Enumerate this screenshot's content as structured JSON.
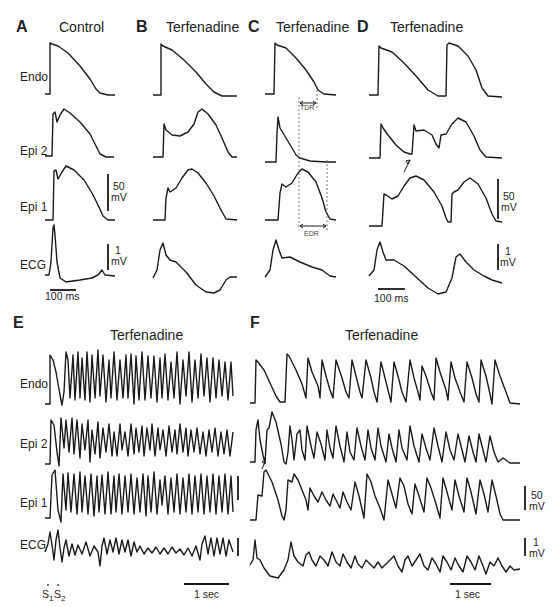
{
  "figure": {
    "panels": [
      {
        "letter": "A",
        "title": "Control"
      },
      {
        "letter": "B",
        "title": "Terfenadine"
      },
      {
        "letter": "C",
        "title": "Terfenadine"
      },
      {
        "letter": "D",
        "title": "Terfenadine"
      },
      {
        "letter": "E",
        "title": "Terfenadine"
      },
      {
        "letter": "F",
        "title": "Terfenadine"
      }
    ],
    "row_labels": [
      "Endo",
      "Epi 2",
      "Epi 1",
      "ECG"
    ],
    "row_labels_bottom": [
      "Endo",
      "Epi 2",
      "Epi 1",
      "ECG"
    ],
    "scale_bars": {
      "voltage_ap": "50\nmV",
      "voltage_ap_line1": "50",
      "voltage_ap_line2": "mV",
      "voltage_ecg_line1": "1",
      "voltage_ecg_line2": "mV",
      "time_short": "100 ms",
      "time_long": "1 sec"
    },
    "annotations": {
      "tdr": "TDR",
      "edr": "EDR",
      "s1": "S",
      "s1_sub": "1",
      "s2": "S",
      "s2_sub": "2"
    }
  }
}
